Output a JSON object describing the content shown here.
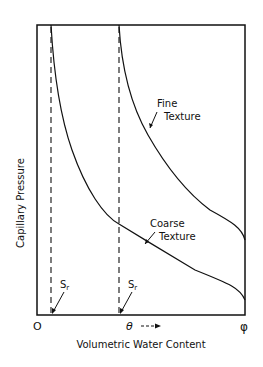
{
  "diagram": {
    "type": "soil water retention curves",
    "y_axis": {
      "label": "Capillary Pressure"
    },
    "x_axis": {
      "label": "Volumetric Water Content",
      "ticks": {
        "origin": "O",
        "theta": "θ",
        "theta_arrow": "⟶",
        "phi": "φ"
      }
    },
    "curves": [
      {
        "id": "fine",
        "label_line1": "Fine",
        "label_line2": "Texture"
      },
      {
        "id": "coarse",
        "label_line1": "Coarse",
        "label_line2": "Texture"
      }
    ],
    "residual_markers": [
      {
        "label": "S",
        "subscript": "r",
        "for": "coarse"
      },
      {
        "label": "S",
        "subscript": "r",
        "for": "fine"
      }
    ],
    "colors": {
      "line": "#111111",
      "background": "#ffffff"
    }
  }
}
